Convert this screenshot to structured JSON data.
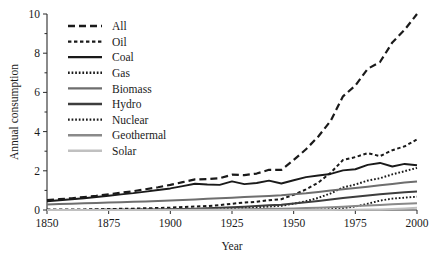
{
  "chart_data": {
    "type": "line",
    "title": "",
    "xlabel": "Year",
    "ylabel": "Annual consumption",
    "xlim": [
      1850,
      2000
    ],
    "ylim": [
      0,
      10
    ],
    "xticks": [
      "1850",
      "1875",
      "1900",
      "1925",
      "1950",
      "1975",
      "2000"
    ],
    "yticks": [
      "0",
      "2",
      "4",
      "6",
      "8",
      "10"
    ],
    "xtick_values": [
      1850,
      1875,
      1900,
      1925,
      1950,
      1975,
      2000
    ],
    "ytick_values": [
      0,
      2,
      4,
      6,
      8,
      10
    ],
    "y_minor_ticks": [
      1,
      3,
      5,
      7,
      9
    ],
    "grid": false,
    "legend_position": "upper-left-inside",
    "x": [
      1850,
      1855,
      1860,
      1865,
      1870,
      1875,
      1880,
      1885,
      1890,
      1895,
      1900,
      1905,
      1910,
      1915,
      1920,
      1925,
      1930,
      1935,
      1940,
      1945,
      1950,
      1955,
      1960,
      1965,
      1970,
      1975,
      1980,
      1985,
      1990,
      1995,
      2000
    ],
    "series": [
      {
        "name": "All",
        "style": "long-dash",
        "color": "#1a1a1a",
        "width": 2.2,
        "values": [
          0.5,
          0.55,
          0.6,
          0.66,
          0.72,
          0.8,
          0.88,
          0.96,
          1.06,
          1.16,
          1.28,
          1.42,
          1.56,
          1.58,
          1.62,
          1.8,
          1.78,
          1.86,
          2.05,
          2.05,
          2.55,
          3.1,
          3.75,
          4.55,
          5.8,
          6.35,
          7.2,
          7.55,
          8.55,
          9.2,
          10.0
        ]
      },
      {
        "name": "Oil",
        "style": "short-dash",
        "color": "#1a1a1a",
        "width": 2.0,
        "values": [
          0.02,
          0.02,
          0.03,
          0.03,
          0.04,
          0.05,
          0.06,
          0.07,
          0.09,
          0.1,
          0.12,
          0.15,
          0.18,
          0.2,
          0.25,
          0.32,
          0.38,
          0.42,
          0.5,
          0.55,
          0.78,
          1.05,
          1.4,
          1.9,
          2.55,
          2.7,
          2.9,
          2.75,
          3.05,
          3.25,
          3.6
        ]
      },
      {
        "name": "Coal",
        "style": "solid",
        "color": "#1a1a1a",
        "width": 1.9,
        "values": [
          0.45,
          0.5,
          0.55,
          0.6,
          0.66,
          0.73,
          0.8,
          0.86,
          0.94,
          1.02,
          1.1,
          1.22,
          1.34,
          1.3,
          1.28,
          1.46,
          1.32,
          1.38,
          1.5,
          1.35,
          1.52,
          1.68,
          1.76,
          1.84,
          2.02,
          2.08,
          2.3,
          2.4,
          2.22,
          2.35,
          2.28
        ]
      },
      {
        "name": "Gas",
        "style": "dotted",
        "color": "#1a1a1a",
        "width": 2.0,
        "values": [
          0.0,
          0.0,
          0.0,
          0.0,
          0.01,
          0.01,
          0.01,
          0.02,
          0.02,
          0.03,
          0.03,
          0.04,
          0.05,
          0.06,
          0.08,
          0.1,
          0.12,
          0.14,
          0.18,
          0.22,
          0.32,
          0.45,
          0.62,
          0.85,
          1.15,
          1.3,
          1.5,
          1.62,
          1.82,
          1.98,
          2.15
        ]
      },
      {
        "name": "Biomass",
        "style": "solid",
        "color": "#6e6e6e",
        "width": 2.0,
        "values": [
          0.28,
          0.3,
          0.32,
          0.34,
          0.36,
          0.38,
          0.4,
          0.42,
          0.44,
          0.46,
          0.48,
          0.51,
          0.54,
          0.57,
          0.6,
          0.63,
          0.66,
          0.69,
          0.72,
          0.75,
          0.8,
          0.85,
          0.92,
          0.99,
          1.06,
          1.12,
          1.19,
          1.26,
          1.33,
          1.4,
          1.46
        ]
      },
      {
        "name": "Hydro",
        "style": "solid",
        "color": "#3d3d3d",
        "width": 2.0,
        "values": [
          0.0,
          0.0,
          0.0,
          0.0,
          0.0,
          0.01,
          0.01,
          0.01,
          0.02,
          0.03,
          0.04,
          0.05,
          0.07,
          0.09,
          0.11,
          0.14,
          0.17,
          0.2,
          0.24,
          0.27,
          0.33,
          0.39,
          0.46,
          0.53,
          0.61,
          0.67,
          0.74,
          0.8,
          0.86,
          0.91,
          0.95
        ]
      },
      {
        "name": "Nuclear",
        "style": "dotted",
        "color": "#1a1a1a",
        "width": 1.9,
        "values": [
          0.0,
          0.0,
          0.0,
          0.0,
          0.0,
          0.0,
          0.0,
          0.0,
          0.0,
          0.0,
          0.0,
          0.0,
          0.0,
          0.0,
          0.0,
          0.0,
          0.0,
          0.0,
          0.0,
          0.0,
          0.0,
          0.01,
          0.02,
          0.04,
          0.09,
          0.18,
          0.32,
          0.48,
          0.58,
          0.63,
          0.68
        ]
      },
      {
        "name": "Geothermal",
        "style": "solid",
        "color": "#8a8a8a",
        "width": 2.0,
        "values": [
          0.0,
          0.0,
          0.0,
          0.0,
          0.0,
          0.0,
          0.0,
          0.0,
          0.0,
          0.01,
          0.01,
          0.01,
          0.02,
          0.02,
          0.03,
          0.03,
          0.04,
          0.05,
          0.06,
          0.07,
          0.08,
          0.1,
          0.12,
          0.14,
          0.17,
          0.2,
          0.23,
          0.26,
          0.29,
          0.32,
          0.35
        ]
      },
      {
        "name": "Solar",
        "style": "solid",
        "color": "#c0c0c0",
        "width": 2.0,
        "values": [
          0.0,
          0.0,
          0.0,
          0.0,
          0.0,
          0.0,
          0.0,
          0.0,
          0.0,
          0.0,
          0.0,
          0.0,
          0.0,
          0.0,
          0.0,
          0.0,
          0.0,
          0.0,
          0.0,
          0.0,
          0.0,
          0.0,
          0.0,
          0.0,
          0.01,
          0.01,
          0.02,
          0.03,
          0.05,
          0.08,
          0.12
        ]
      }
    ]
  },
  "legend": {
    "entries": [
      {
        "label": "All"
      },
      {
        "label": "Oil"
      },
      {
        "label": "Coal"
      },
      {
        "label": "Gas"
      },
      {
        "label": "Biomass"
      },
      {
        "label": "Hydro"
      },
      {
        "label": "Nuclear"
      },
      {
        "label": "Geothermal"
      },
      {
        "label": "Solar"
      }
    ]
  },
  "axes": {
    "y_title": "Annual consumption",
    "x_title": "Year"
  }
}
